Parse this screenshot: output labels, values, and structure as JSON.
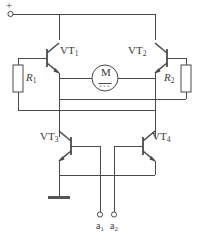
{
  "diagram": {
    "type": "schematic",
    "width": 197,
    "height": 237,
    "line_color": "#4a4a4a",
    "background": "#ffffff"
  },
  "supply": {
    "polarity_label": "+",
    "terminal_name": "positive-supply-terminal"
  },
  "transistors": [
    {
      "id": "VT1",
      "label": "VT",
      "subscript": "1",
      "kind": "npn",
      "orientation": "base-left"
    },
    {
      "id": "VT2",
      "label": "VT",
      "subscript": "2",
      "kind": "npn",
      "orientation": "base-right"
    },
    {
      "id": "VT3",
      "label": "VT",
      "subscript": "3",
      "kind": "npn",
      "orientation": "base-left"
    },
    {
      "id": "VT4",
      "label": "VT",
      "subscript": "4",
      "kind": "npn",
      "orientation": "base-right"
    }
  ],
  "resistors": [
    {
      "id": "R1",
      "label": "R",
      "subscript": "1",
      "position": "left"
    },
    {
      "id": "R2",
      "label": "R",
      "subscript": "2",
      "position": "right"
    }
  ],
  "motor": {
    "label": "M",
    "symbol": "dc-motor",
    "name": "motor-symbol"
  },
  "ground": {
    "symbol": "earth-bar",
    "name": "ground-symbol"
  },
  "input_terminals": [
    {
      "id": "a1",
      "label": "a",
      "subscript": "1"
    },
    {
      "id": "a2",
      "label": "a",
      "subscript": "2"
    }
  ]
}
